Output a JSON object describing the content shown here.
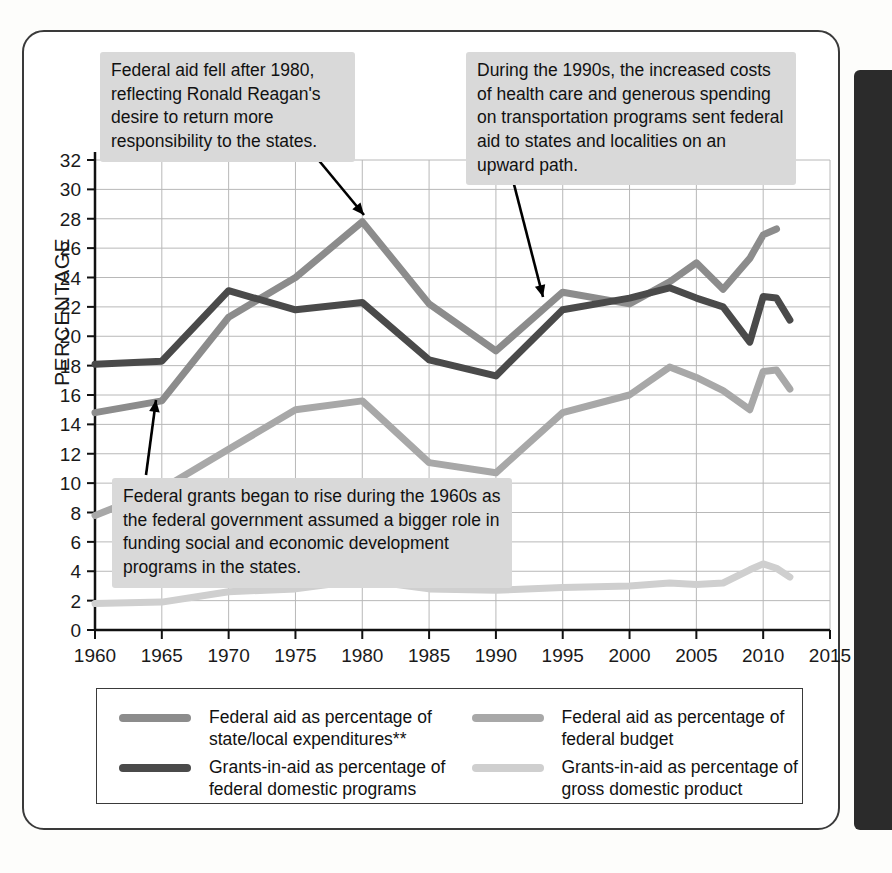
{
  "figure": {
    "y_axis_title": "PERCENTAGE"
  },
  "annotations": [
    {
      "id": "reagan-note",
      "text": "Federal aid fell after 1980, reflecting Ronald Reagan's desire to return more responsibility to the states."
    },
    {
      "id": "nineties-note",
      "text": "During the 1990s, the increased costs of health care and generous spending on transportation programs sent federal aid to states and localities on an upward path."
    },
    {
      "id": "sixties-note",
      "text": "Federal grants began to rise during the 1960s as the federal  government assumed a bigger role in funding social and economic development programs in the states."
    }
  ],
  "legend": {
    "items": [
      {
        "label": "Federal aid as percentage of state/local expenditures**",
        "color": "#8c8c8c"
      },
      {
        "label": "Federal aid as percentage of federal budget",
        "color": "#a8a8a8"
      },
      {
        "label": "Grants-in-aid as percentage of federal domestic programs",
        "color": "#4a4a4a"
      },
      {
        "label": "Grants-in-aid as percentage of gross domestic product",
        "color": "#cfcfcf"
      }
    ]
  },
  "chart_data": {
    "type": "line",
    "title": "",
    "xlabel": "",
    "ylabel": "PERCENTAGE",
    "xlim": [
      1960,
      2015
    ],
    "ylim": [
      0,
      32
    ],
    "xticks": [
      1960,
      1965,
      1970,
      1975,
      1980,
      1985,
      1990,
      1995,
      2000,
      2005,
      2010,
      2015
    ],
    "yticks": [
      0,
      2,
      4,
      6,
      8,
      10,
      12,
      14,
      16,
      18,
      20,
      22,
      24,
      26,
      28,
      30,
      32
    ],
    "grid": true,
    "legend_position": "below-plot",
    "x": [
      1960,
      1965,
      1970,
      1975,
      1980,
      1985,
      1990,
      1995,
      2000,
      2003,
      2005,
      2007,
      2009,
      2010,
      2011,
      2012
    ],
    "series": [
      {
        "name": "Federal aid as percentage of state/local expenditures**",
        "color": "#8c8c8c",
        "values": [
          14.8,
          15.6,
          21.3,
          24.0,
          27.8,
          22.2,
          19.0,
          23.0,
          22.2,
          23.7,
          25.0,
          23.2,
          25.3,
          26.9,
          27.3,
          null
        ]
      },
      {
        "name": "Grants-in-aid as percentage of federal domestic programs",
        "color": "#4a4a4a",
        "values": [
          18.1,
          18.3,
          23.1,
          21.8,
          22.3,
          18.4,
          17.3,
          21.8,
          22.6,
          23.3,
          22.6,
          22.0,
          19.6,
          22.7,
          22.6,
          21.1
        ]
      },
      {
        "name": "Federal aid as percentage of federal budget",
        "color": "#a8a8a8",
        "values": [
          7.8,
          9.6,
          12.3,
          15.0,
          15.6,
          11.4,
          10.7,
          14.8,
          16.0,
          17.9,
          17.2,
          16.3,
          15.0,
          17.6,
          17.7,
          16.4
        ]
      },
      {
        "name": "Grants-in-aid as percentage of gross domestic product",
        "color": "#cfcfcf",
        "values": [
          1.8,
          1.9,
          2.6,
          2.8,
          3.4,
          2.8,
          2.7,
          2.9,
          3.0,
          3.2,
          3.1,
          3.2,
          4.1,
          4.5,
          4.2,
          3.6
        ]
      }
    ]
  }
}
